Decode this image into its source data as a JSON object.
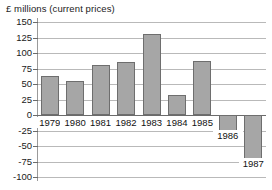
{
  "chart_data": {
    "type": "bar",
    "title": "£ millions (current prices)",
    "xlabel": "",
    "ylabel": "£ millions (current prices)",
    "categories": [
      "1979",
      "1980",
      "1981",
      "1982",
      "1983",
      "1984",
      "1985",
      "1986",
      "1987"
    ],
    "values": [
      63,
      55,
      80,
      85,
      130,
      33,
      87,
      -42,
      -87
    ],
    "ylim": [
      -100,
      150
    ],
    "yticks": [
      150,
      125,
      100,
      75,
      50,
      25,
      0,
      -25,
      -50,
      -75,
      -100
    ],
    "ytick_labels": [
      "150",
      "125",
      "100",
      "75",
      "50",
      "25",
      "0",
      "-25",
      "-50",
      "-75",
      "-100"
    ],
    "grid": true,
    "legend": false,
    "bar_color": "#a6a6a6",
    "bar_border_color": "#6e6e6e",
    "gridline_color": "#b9b9b9",
    "axis_color": "#6b6b6b"
  }
}
